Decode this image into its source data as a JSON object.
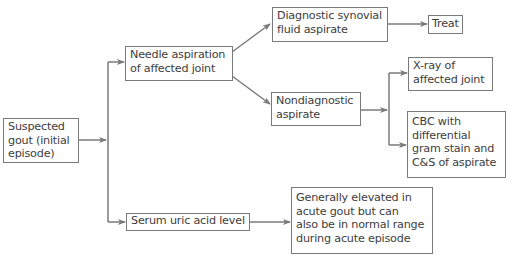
{
  "diagram": {
    "type": "flowchart",
    "nodes": {
      "suspected": "Suspected\ngout (initial\nepisode)",
      "needle": "Needle aspiration\nof affected joint",
      "diagnostic": "Diagnostic synovial\nfluid aspirate",
      "treat": "Treat",
      "nondiagnostic": "Nondiagnostic\naspirate",
      "xray": "X-ray of\naffected joint",
      "cbc": "CBC with\ndifferential\ngram stain and\nC&S of aspirate",
      "serum": "Serum uric acid level",
      "generally": "Generally elevated in\nacute gout but can\nalso be in normal range\nduring acute episode"
    },
    "edges": [
      [
        "suspected",
        "needle"
      ],
      [
        "suspected",
        "serum"
      ],
      [
        "needle",
        "diagnostic"
      ],
      [
        "needle",
        "nondiagnostic"
      ],
      [
        "diagnostic",
        "treat"
      ],
      [
        "nondiagnostic",
        "xray"
      ],
      [
        "nondiagnostic",
        "cbc"
      ],
      [
        "serum",
        "generally"
      ]
    ],
    "colors": {
      "line": "#7a7a7a",
      "text": "#3d3d3d",
      "background": "#ffffff"
    }
  }
}
